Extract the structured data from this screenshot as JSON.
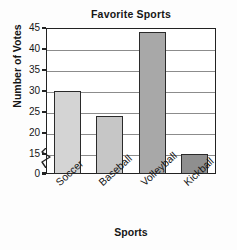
{
  "chart_data": {
    "type": "bar",
    "title": "Favorite Sports",
    "xlabel": "Sports",
    "ylabel": "Number of Votes",
    "categories": [
      "Soccer",
      "Baseball",
      "Volleyball",
      "Kickball"
    ],
    "values": [
      30,
      24,
      44,
      15
    ],
    "series": [
      {
        "name": "Number of Votes",
        "values": [
          30,
          24,
          44,
          15
        ]
      }
    ],
    "ylim": [
      0,
      45
    ],
    "y_ticks": [
      0,
      15,
      20,
      25,
      30,
      35,
      40,
      45
    ],
    "y_tick_labels": [
      "0",
      "15",
      "20",
      "25",
      "30",
      "35",
      "40",
      "45"
    ],
    "axis_break": {
      "present": true,
      "between": [
        0,
        15
      ],
      "symbol": "zigzag"
    },
    "grid": true,
    "grid_axis": "y",
    "legend": "none",
    "bar_colors": [
      "#d4d4d4",
      "#c6c6c6",
      "#a8a8a8",
      "#8f8f8f"
    ],
    "bar_edge_color": "#2a2a2a",
    "plot_background": "#ffffff",
    "frame_color": "#222222",
    "gridline_color": "#8c8c8c"
  }
}
